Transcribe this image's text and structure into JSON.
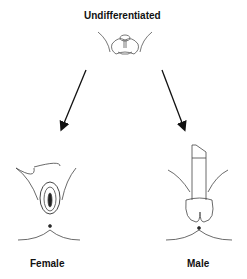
{
  "diagram": {
    "top_label": "Undifferentiated",
    "left_label": "Female",
    "right_label": "Male",
    "nodes": [
      {
        "id": "undifferentiated",
        "label": "Undifferentiated",
        "icon": "undifferentiated-genitalia-illustration"
      },
      {
        "id": "female",
        "label": "Female",
        "icon": "female-genitalia-illustration"
      },
      {
        "id": "male",
        "label": "Male",
        "icon": "male-genitalia-illustration"
      }
    ],
    "edges": [
      {
        "from": "undifferentiated",
        "to": "female"
      },
      {
        "from": "undifferentiated",
        "to": "male"
      }
    ],
    "colors": {
      "line": "#111111",
      "sketch": "#555555",
      "background": "#ffffff"
    }
  }
}
